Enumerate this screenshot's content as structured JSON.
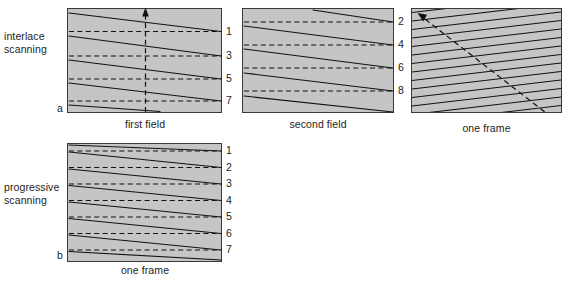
{
  "figure": {
    "rows": [
      {
        "id": "interlace",
        "label": "interlace\nscanning",
        "marker": "a"
      },
      {
        "id": "progressive",
        "label": "progressive\nscanning",
        "marker": "b"
      }
    ],
    "panels": [
      {
        "id": "first-field",
        "caption": "first field",
        "marker": "a",
        "line_numbers": [
          "1",
          "3",
          "5",
          "7"
        ],
        "scan_line_count": 5,
        "retrace_count": 4,
        "has_vertical_arrow": true,
        "arrow_direction": "up"
      },
      {
        "id": "second-field",
        "caption": "second field",
        "marker": "",
        "line_numbers": [
          "2",
          "4",
          "6",
          "8"
        ],
        "scan_line_count": 5,
        "retrace_count": 4,
        "has_vertical_arrow": false,
        "arrow_direction": ""
      },
      {
        "id": "one-frame-interlaced",
        "caption": "one frame",
        "marker": "",
        "line_numbers": [],
        "scan_line_count": 15,
        "retrace_count": 0,
        "has_vertical_arrow": false,
        "arrow_direction": "diagonal-up-left"
      },
      {
        "id": "one-frame-progressive",
        "caption": "one frame",
        "marker": "b",
        "line_numbers": [
          "1",
          "2",
          "3",
          "4",
          "5",
          "6",
          "7"
        ],
        "scan_line_count": 7,
        "retrace_count": 7,
        "has_vertical_arrow": false,
        "arrow_direction": ""
      }
    ],
    "colors": {
      "panel_fill": "#c5c5c5",
      "panel_stroke": "#3a3a3a",
      "scan_line": "#111111",
      "retrace_line": "#111111",
      "arrow": "#111111",
      "text": "#1c1c1c",
      "background": "#ffffff"
    }
  }
}
